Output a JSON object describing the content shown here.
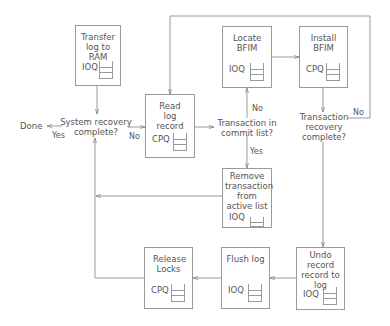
{
  "boxes": {
    "transfer_log": {
      "title": "Transfer log to RAM",
      "queue": "IOQ"
    },
    "locate_bfim": {
      "title": "Locate BFIM",
      "queue": "IOQ"
    },
    "install_bfim": {
      "title": "Install BFIM",
      "queue": "CPQ"
    },
    "read_log": {
      "title": "Read log record",
      "queue": "CPQ"
    },
    "remove_transaction": {
      "title": "Remove transaction from active list",
      "queue": "IOQ"
    },
    "release_locks": {
      "title": "Release Locks",
      "queue": "CPQ"
    },
    "flush_log": {
      "title": "Flush log",
      "queue": "IOQ"
    },
    "undo_record": {
      "title": "Undo record record to log",
      "queue": "IOQ"
    }
  },
  "decisions": {
    "system_recovery": "System recovery complete?",
    "commit_list": "Transaction in commit list?",
    "transaction_recovery": "Transaction recovery complete?"
  },
  "terminal": {
    "done": "Done"
  },
  "edge_labels": {
    "yes_done": "Yes",
    "no_read": "No",
    "no_locate": "No",
    "yes_remove": "Yes",
    "no_loop": "No"
  }
}
